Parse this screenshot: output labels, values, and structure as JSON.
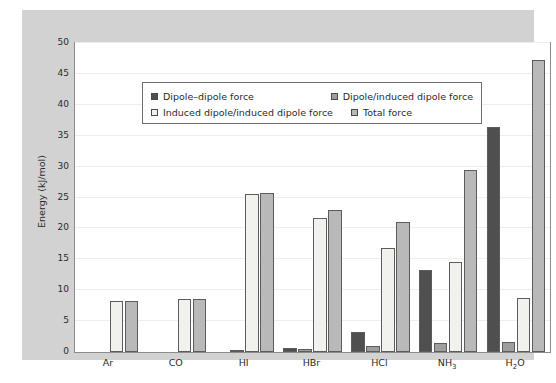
{
  "chart_data": {
    "type": "bar",
    "title": "",
    "xlabel": "",
    "ylabel": "Energy (kJ/mol)",
    "ylim": [
      0,
      50
    ],
    "yticks": [
      0,
      5,
      10,
      15,
      20,
      25,
      30,
      35,
      40,
      45,
      50
    ],
    "grid": true,
    "legend_position": "upper-left-inside",
    "categories": [
      "Ar",
      "CO",
      "HI",
      "HBr",
      "HCl",
      "NH3",
      "H2O"
    ],
    "category_labels_html": [
      "Ar",
      "CO",
      "HI",
      "HBr",
      "HCl",
      "NH<sub>3</sub>",
      "H<sub>2</sub>O"
    ],
    "series": [
      {
        "name": "Dipole–dipole force",
        "color": "#4f4f4f",
        "values": [
          0,
          0,
          0,
          0.7,
          3.3,
          13.2,
          36.4
        ]
      },
      {
        "name": "Dipole/induced dipole force",
        "color": "#9e9e9e",
        "values": [
          0,
          0,
          0.1,
          0.5,
          1.0,
          1.5,
          1.7
        ]
      },
      {
        "name": "Induced dipole/induced dipole force",
        "color": "#f1f1ee",
        "values": [
          8.3,
          8.5,
          25.5,
          21.7,
          16.8,
          14.6,
          8.8
        ]
      },
      {
        "name": "Total force",
        "color": "#b9b9b9",
        "values": [
          8.3,
          8.5,
          25.7,
          23.0,
          21.0,
          29.5,
          47.3
        ]
      }
    ]
  },
  "legend": {
    "entries": [
      "Dipole–dipole force",
      "Dipole/induced dipole force",
      "Induced dipole/induced dipole force",
      "Total force"
    ]
  },
  "colors": {
    "figure_background": "#d2d2d2",
    "plot_background": "#ffffff",
    "axis": "#8c8c8c",
    "gridline": "#eeeeee",
    "text": "#2b2b2b"
  }
}
